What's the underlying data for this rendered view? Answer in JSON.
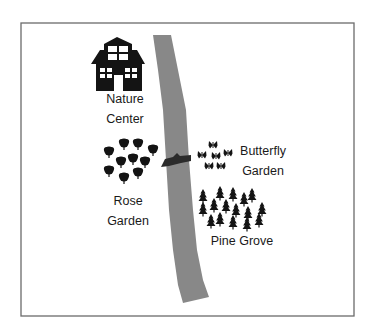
{
  "map": {
    "frame": {
      "x": 21,
      "y": 23,
      "width": 333,
      "height": 293,
      "stroke": "#6b6b6b"
    },
    "river": {
      "color": "#888888",
      "left_edge": [
        [
          153,
          35
        ],
        [
          158,
          70
        ],
        [
          163,
          110
        ],
        [
          166,
          160
        ],
        [
          169,
          210
        ],
        [
          173,
          250
        ],
        [
          178,
          285
        ],
        [
          183,
          303
        ]
      ],
      "right_edge": [
        [
          171,
          35
        ],
        [
          178,
          70
        ],
        [
          186,
          110
        ],
        [
          189,
          160
        ],
        [
          193,
          210
        ],
        [
          197,
          250
        ],
        [
          203,
          280
        ],
        [
          209,
          297
        ]
      ]
    },
    "bridge": {
      "color": "#2b2b2b",
      "x": 161,
      "y": 153,
      "width": 30,
      "height": 14
    },
    "icon_color": "#141414",
    "locations": [
      {
        "name": "Nature Center",
        "lines": [
          "Nature",
          "Center"
        ],
        "icon": "house-icon",
        "label_x": 125,
        "label_y": 89
      },
      {
        "name": "Rose Garden",
        "lines": [
          "Rose",
          "Garden"
        ],
        "icon": "rose-bush-icon",
        "label_x": 128,
        "label_y": 191
      },
      {
        "name": "Butterfly Garden",
        "lines": [
          "Butterfly",
          "Garden"
        ],
        "icon": "butterfly-icon",
        "label_x": 263,
        "label_y": 141
      },
      {
        "name": "Pine Grove",
        "lines": [
          "Pine Grove"
        ],
        "icon": "pine-tree-icon",
        "label_x": 242,
        "label_y": 231
      }
    ],
    "rose_bushes": [
      [
        124,
        143
      ],
      [
        138,
        143
      ],
      [
        109,
        151
      ],
      [
        153,
        149
      ],
      [
        121,
        161
      ],
      [
        133,
        158
      ],
      [
        145,
        161
      ],
      [
        109,
        170
      ],
      [
        124,
        177
      ],
      [
        138,
        172
      ]
    ],
    "butterflies": [
      [
        213,
        145
      ],
      [
        202,
        155
      ],
      [
        216,
        156
      ],
      [
        228,
        153
      ],
      [
        209,
        166
      ],
      [
        221,
        166
      ]
    ],
    "pine_trees": [
      [
        203,
        195
      ],
      [
        220,
        192
      ],
      [
        233,
        193
      ],
      [
        244,
        198
      ],
      [
        252,
        194
      ],
      [
        203,
        208
      ],
      [
        214,
        204
      ],
      [
        226,
        205
      ],
      [
        236,
        209
      ],
      [
        248,
        212
      ],
      [
        262,
        208
      ],
      [
        211,
        220
      ],
      [
        220,
        218
      ],
      [
        233,
        221
      ],
      [
        247,
        223
      ],
      [
        259,
        219
      ]
    ]
  }
}
